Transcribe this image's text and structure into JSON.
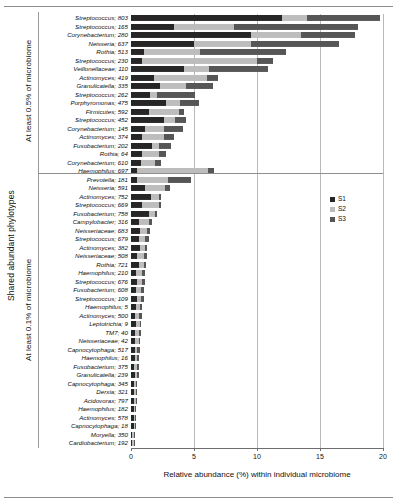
{
  "chart_data": {
    "type": "bar",
    "orientation": "horizontal",
    "stacked": true,
    "title": "",
    "xlabel": "Relative abundance (%) within individual microbiome",
    "ylabel": "Shared abundant phylotypes",
    "xlim": [
      0,
      20
    ],
    "xticks": [
      0,
      5,
      10,
      15,
      20
    ],
    "xticklabels": [
      "0",
      "5",
      "10",
      "15",
      "20"
    ],
    "grid": true,
    "grid_axis": "x",
    "legend_position": "right",
    "series": [
      {
        "name": "S1",
        "color": "#262626"
      },
      {
        "name": "S2",
        "color": "#bdbdbd"
      },
      {
        "name": "S3",
        "color": "#565656"
      }
    ],
    "groups": [
      {
        "label": "At least 0.5% of microbiome",
        "categories": [
          "Streptococcus; 803",
          "Streptococcus; 165",
          "Corynebacterium; 280",
          "Neisseria; 637",
          "Rothia; 513",
          "Streptococcus; 230",
          "Veillonellaceae; 110",
          "Actinomyces; 419",
          "Granulicatella; 335",
          "Streptococcus; 262",
          "Porphyromonas; 475",
          "Firmicutes; 592",
          "Streptococcus; 452",
          "Corynebacterium; 145",
          "Actinomyces; 374",
          "Fusobacterium; 202",
          "Rothia; 64",
          "Corynebacterium; 610"
        ],
        "values": [
          [
            12.0,
            2.0,
            5.8
          ],
          [
            3.4,
            4.8,
            9.8
          ],
          [
            9.5,
            4.0,
            4.3
          ],
          [
            5.0,
            4.5,
            7.0
          ],
          [
            1.0,
            4.5,
            6.8
          ],
          [
            0.9,
            9.1,
            1.3
          ],
          [
            4.2,
            2.0,
            4.7
          ],
          [
            1.8,
            4.2,
            0.9
          ],
          [
            2.3,
            2.1,
            2.1
          ],
          [
            1.5,
            0.6,
            3.0
          ],
          [
            2.8,
            1.1,
            1.5
          ],
          [
            1.4,
            2.4,
            0.4
          ],
          [
            2.6,
            0.9,
            0.9
          ],
          [
            1.1,
            1.5,
            1.5
          ],
          [
            0.9,
            1.7,
            0.8
          ],
          [
            1.7,
            0.5,
            1.0
          ],
          [
            0.9,
            1.3,
            0.6
          ],
          [
            0.8,
            1.1,
            0.5
          ]
        ]
      },
      {
        "label": "At least 0.1% of microbiome",
        "categories": [
          "Haemophilus; 697",
          "Prevotella; 181",
          "Neisseria; 591",
          "Actinomyces; 752",
          "Streptococcus; 669",
          "Fusobacterium; 758",
          "Campylobacter; 316",
          "Neisseriaceae; 683",
          "Streptococcus; 679",
          "Actinomyces; 382",
          "Neisseriaceae; 508",
          "Rothia; 721",
          "Haemophilus; 210",
          "Streptococcus; 676",
          "Fusobacterium; 608",
          "Streptococcus; 109",
          "Haemophilus; 5",
          "Actinomyces; 500",
          "Leptotrichia; 9",
          "TM7; 40",
          "Neisseriaceae; 42",
          "Capnocytophaga; 517",
          "Haemophilus; 16",
          "Fusobacterium; 375",
          "Granulicatella; 239",
          "Capnocytophaga; 345",
          "Derxia; 321",
          "Acidovorax; 797",
          "Haemophilus; 182",
          "Actinomyces; 578",
          "Capnocytophaga; 18",
          "Moryella; 350",
          "Cardiobacterium; 192"
        ],
        "values": [
          [
            0.5,
            5.6,
            0.5
          ],
          [
            0.5,
            2.4,
            1.9
          ],
          [
            1.1,
            1.6,
            0.4
          ],
          [
            1.6,
            0.6,
            0.2
          ],
          [
            0.9,
            1.3,
            0.2
          ],
          [
            1.4,
            0.5,
            0.2
          ],
          [
            0.6,
            0.8,
            0.3
          ],
          [
            0.7,
            0.6,
            0.2
          ],
          [
            0.6,
            0.5,
            0.3
          ],
          [
            0.7,
            0.4,
            0.2
          ],
          [
            0.5,
            0.5,
            0.3
          ],
          [
            0.6,
            0.4,
            0.2
          ],
          [
            0.4,
            0.5,
            0.2
          ],
          [
            0.5,
            0.4,
            0.2
          ],
          [
            0.4,
            0.4,
            0.2
          ],
          [
            0.5,
            0.3,
            0.2
          ],
          [
            0.4,
            0.3,
            0.2
          ],
          [
            0.3,
            0.3,
            0.3
          ],
          [
            0.4,
            0.3,
            0.1
          ],
          [
            0.3,
            0.3,
            0.2
          ],
          [
            0.3,
            0.3,
            0.1
          ],
          [
            0.3,
            0.2,
            0.2
          ],
          [
            0.3,
            0.2,
            0.1
          ],
          [
            0.2,
            0.3,
            0.1
          ],
          [
            0.3,
            0.2,
            0.1
          ],
          [
            0.2,
            0.2,
            0.1
          ],
          [
            0.2,
            0.2,
            0.1
          ],
          [
            0.2,
            0.2,
            0.1
          ],
          [
            0.2,
            0.1,
            0.1
          ],
          [
            0.2,
            0.1,
            0.1
          ],
          [
            0.2,
            0.1,
            0.1
          ],
          [
            0.1,
            0.1,
            0.1
          ],
          [
            0.1,
            0.1,
            0.1
          ]
        ]
      }
    ]
  },
  "axis": {
    "y_title": "Shared abundant phylotypes",
    "x_title": "Relative abundance (%) within individual microbiome"
  },
  "legend": {
    "items": [
      {
        "label": "S1",
        "color": "#262626"
      },
      {
        "label": "S2",
        "color": "#bdbdbd"
      },
      {
        "label": "S3",
        "color": "#565656"
      }
    ]
  }
}
